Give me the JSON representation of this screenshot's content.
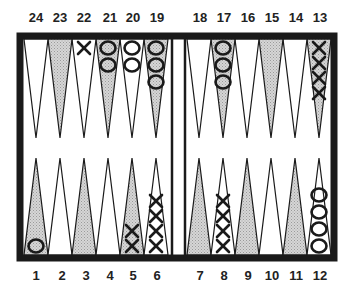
{
  "board": {
    "title": "Backgammon board position",
    "colors": {
      "frame": "#1a1a1a",
      "shaded_point": "#c8c8c8",
      "light_point": "#ffffff",
      "checker_stroke": "#1a1a1a"
    },
    "top_labels": [
      "24",
      "23",
      "22",
      "21",
      "20",
      "19",
      "18",
      "17",
      "16",
      "15",
      "14",
      "13"
    ],
    "bottom_labels": [
      "1",
      "2",
      "3",
      "4",
      "5",
      "6",
      "7",
      "8",
      "9",
      "10",
      "11",
      "12"
    ],
    "points": [
      {
        "point": 1,
        "shaded": true,
        "checker": "O",
        "count": 1
      },
      {
        "point": 2,
        "shaded": false,
        "checker": "",
        "count": 0
      },
      {
        "point": 3,
        "shaded": true,
        "checker": "",
        "count": 0
      },
      {
        "point": 4,
        "shaded": false,
        "checker": "",
        "count": 0
      },
      {
        "point": 5,
        "shaded": true,
        "checker": "X",
        "count": 2
      },
      {
        "point": 6,
        "shaded": false,
        "checker": "X",
        "count": 4
      },
      {
        "point": 7,
        "shaded": true,
        "checker": "",
        "count": 0
      },
      {
        "point": 8,
        "shaded": false,
        "checker": "X",
        "count": 4
      },
      {
        "point": 9,
        "shaded": true,
        "checker": "",
        "count": 0
      },
      {
        "point": 10,
        "shaded": false,
        "checker": "",
        "count": 0
      },
      {
        "point": 11,
        "shaded": true,
        "checker": "",
        "count": 0
      },
      {
        "point": 12,
        "shaded": false,
        "checker": "O",
        "count": 4
      },
      {
        "point": 13,
        "shaded": true,
        "checker": "X",
        "count": 4
      },
      {
        "point": 14,
        "shaded": false,
        "checker": "",
        "count": 0
      },
      {
        "point": 15,
        "shaded": true,
        "checker": "",
        "count": 0
      },
      {
        "point": 16,
        "shaded": false,
        "checker": "",
        "count": 0
      },
      {
        "point": 17,
        "shaded": true,
        "checker": "O",
        "count": 3
      },
      {
        "point": 18,
        "shaded": false,
        "checker": "",
        "count": 0
      },
      {
        "point": 19,
        "shaded": true,
        "checker": "O",
        "count": 3
      },
      {
        "point": 20,
        "shaded": false,
        "checker": "O",
        "count": 2
      },
      {
        "point": 21,
        "shaded": true,
        "checker": "O",
        "count": 2
      },
      {
        "point": 22,
        "shaded": false,
        "checker": "X",
        "count": 1
      },
      {
        "point": 23,
        "shaded": true,
        "checker": "",
        "count": 0
      },
      {
        "point": 24,
        "shaded": false,
        "checker": "",
        "count": 0
      }
    ]
  }
}
